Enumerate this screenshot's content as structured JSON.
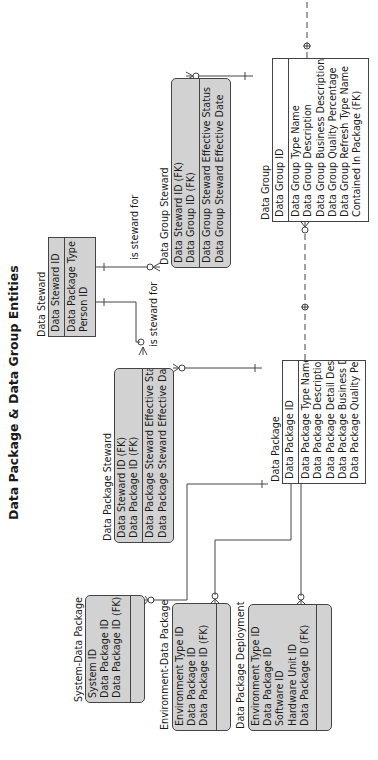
{
  "title": "Data Package & Data Group Entities",
  "entities": {
    "data_steward": {
      "name": "Data Steward",
      "keys": [
        "Data Steward ID"
      ],
      "attributes": [
        "Data Package Type",
        "Person ID"
      ]
    },
    "data_group_steward": {
      "name": "Data Group Steward",
      "keys": [
        "Data Steward ID (FK)",
        "Data Group ID (FK)"
      ],
      "attributes": [
        "Data Group Steward Effective Status",
        "Data Group Steward Effective Date"
      ]
    },
    "data_package_steward": {
      "name": "Data Package Steward",
      "keys": [
        "Data Steward ID (FK)",
        "Data Package ID (FK)"
      ],
      "attributes": [
        "Data Package Steward Effective Status",
        "Data Package Steward Effective Date"
      ]
    },
    "data_group": {
      "name": "Data Group",
      "keys": [
        "Data Group ID"
      ],
      "attributes": [
        "Data Group Type Name",
        "Data Group Description",
        "Data Group Business Description",
        "Data Group Quality Percentage",
        "Data Group Refresh Type Name",
        "Contained In Package (FK)"
      ]
    },
    "data_package": {
      "name": "Data Package",
      "keys": [
        "Data Package ID"
      ],
      "attributes": [
        "Data Package Type Name",
        "Data Package Description",
        "Data Package Detail Description",
        "Data Package Business Description",
        "Data Package Quality Percentage"
      ]
    },
    "system_data_package": {
      "name": "System-Data Package",
      "keys": [
        "System ID",
        "Data Package ID",
        "Data Package ID (FK)"
      ],
      "attributes": []
    },
    "environment_data_package": {
      "name": "Environment-Data Package",
      "keys": [
        "Environment Type ID",
        "Data Package ID",
        "Data Package ID (FK)"
      ],
      "attributes": []
    },
    "data_package_deployment": {
      "name": "Data Package Deployment",
      "keys": [
        "Environment Type ID",
        "Data Package ID",
        "Software ID",
        "Hardware Unit ID",
        "Data Package ID (FK)"
      ],
      "attributes": []
    }
  },
  "relationships": {
    "steward_to_group_label": "is steward for",
    "steward_to_package_label": "is steward for"
  },
  "colors": {
    "dependent_fill": "#d2d2d2",
    "independent_fill": "#ffffff",
    "line": "#444444"
  }
}
